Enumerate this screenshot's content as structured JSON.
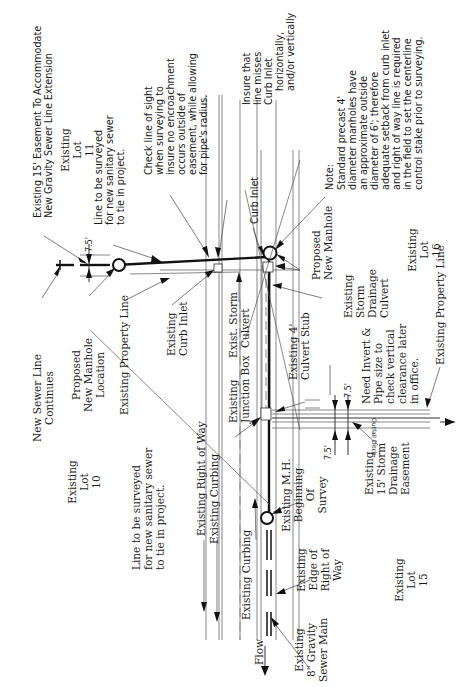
{
  "diagram": {
    "orientation": "rotated-90-ccw",
    "labels": {
      "easement_15": [
        "Existing 15' Easement To Accommodate",
        "New Gravity Sewer Line Extension"
      ],
      "lot_11": [
        "Existing",
        "Lot",
        "11"
      ],
      "line_surveyed_top": [
        "Line to be surveyed",
        "for new sanitary sewer",
        "to tie in project."
      ],
      "check_line_of_sight": [
        "Check line of sight",
        "when surveying to",
        "insure no encroachment",
        "occurs outside of",
        "easement, while allowing",
        "for pipe's radius."
      ],
      "insure_misses": [
        "Insure that",
        "line misses",
        "Curb Inlet",
        "horizontally,",
        "and/or vertically"
      ],
      "curb_inlet_top": "Curb Inlet",
      "note": [
        "Note:",
        "Standard precast 4'",
        "diameter manholes have",
        "an approximate outside",
        "diameter of 6'; therefore",
        "adequate setback from curb inlet",
        "and right of way line is required",
        "in the field to set the centerline",
        "control stake prior to surveying."
      ],
      "new_sewer_continues": [
        "New Sewer Line",
        "Continues"
      ],
      "proposed_manhole_location": [
        "Proposed",
        "New Manhole",
        "Location"
      ],
      "existing_property_line_left": "Existing Property Line",
      "existing_curb_inlet": [
        "Existing",
        "Curb Inlet"
      ],
      "exist_storm_culvert": [
        "Exist. Storm",
        "Culvert"
      ],
      "existing_junction_box": [
        "Existing",
        "Junction Box"
      ],
      "existing_culvert_stub": [
        "Existing 4'",
        "Culvert Stub"
      ],
      "proposed_new_manhole": [
        "Proposed",
        "New Manhole"
      ],
      "existing_storm_drainage_culvert": [
        "Existing",
        "Storm",
        "Drainage",
        "Culvert"
      ],
      "lot_16": [
        "Existing",
        "Lot",
        "16"
      ],
      "existing_property_line_right": "Existing Property Line",
      "need_invert": [
        "Need Invert &",
        "Pipe size to",
        "check vertical",
        "clearance later",
        "in office."
      ],
      "outfall_ditch": "Outfall Ditch",
      "lot_10": [
        "Existing",
        "Lot",
        "10"
      ],
      "line_surveyed_bottom": [
        "Line to be surveyed",
        "for new sanitary sewer",
        "to tie in project."
      ],
      "existing_right_of_way": "Existing Right of Way",
      "existing_curbing_upper": "Existing Curbing",
      "existing_curbing_lower": "Existing Curbing",
      "existing_mh": [
        "Existing M.H.",
        "Beginning",
        "Of",
        "Survey"
      ],
      "existing_edge_row": [
        "Existing",
        "Edge of",
        "Right of",
        "Way"
      ],
      "existing_8_gravity": [
        "Existing",
        "8\" Gravity",
        "Sewer Main"
      ],
      "existing_15_storm_easement": [
        "Existing",
        "15' Storm",
        "Drainage",
        "Easement"
      ],
      "lot_15": [
        "Existing",
        "Lot",
        "15"
      ],
      "flow": "Flow",
      "dim_top": "7.5'",
      "dim_right_a": "7.5'",
      "dim_right_b": "7.5'"
    }
  }
}
